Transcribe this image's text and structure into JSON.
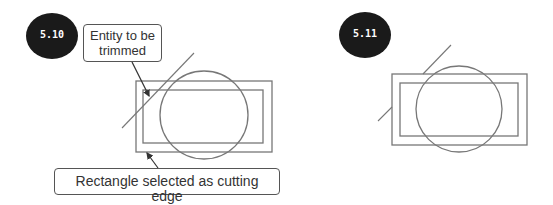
{
  "figures": [
    {
      "badge": "5.10",
      "callouts": {
        "entity": "Entity to be trimmed",
        "cutting_edge": "Rectangle selected as cutting edge"
      }
    },
    {
      "badge": "5.11"
    }
  ],
  "colors": {
    "badge_fill": "#1a1a1a",
    "line": "#666666",
    "callout_border": "#555555"
  }
}
